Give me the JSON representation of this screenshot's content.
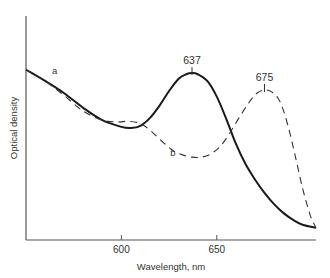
{
  "chart_data": {
    "type": "line",
    "title": "",
    "xlabel": "Wavelength, nm",
    "ylabel": "Optical density",
    "xlim": [
      550,
      702
    ],
    "ylim": [
      0,
      1
    ],
    "grid": false,
    "legend": "none (inline labels)",
    "x_ticks": [
      {
        "value": 600,
        "label": "600"
      },
      {
        "value": 650,
        "label": "650"
      }
    ],
    "series": [
      {
        "name": "a",
        "style": "solid",
        "label_at": {
          "x": 565,
          "y": 0.74
        },
        "points": [
          [
            550,
            0.76
          ],
          [
            560,
            0.71
          ],
          [
            570,
            0.655
          ],
          [
            580,
            0.59
          ],
          [
            590,
            0.535
          ],
          [
            600,
            0.505
          ],
          [
            605,
            0.5
          ],
          [
            610,
            0.51
          ],
          [
            615,
            0.545
          ],
          [
            620,
            0.6
          ],
          [
            625,
            0.665
          ],
          [
            630,
            0.72
          ],
          [
            634,
            0.74
          ],
          [
            637,
            0.745
          ],
          [
            640,
            0.74
          ],
          [
            645,
            0.71
          ],
          [
            650,
            0.64
          ],
          [
            655,
            0.54
          ],
          [
            660,
            0.43
          ],
          [
            665,
            0.34
          ],
          [
            670,
            0.27
          ],
          [
            675,
            0.21
          ],
          [
            680,
            0.16
          ],
          [
            685,
            0.12
          ],
          [
            690,
            0.09
          ],
          [
            695,
            0.068
          ],
          [
            702,
            0.054
          ]
        ]
      },
      {
        "name": "b",
        "style": "dashed",
        "label_at": {
          "x": 627,
          "y": 0.375
        },
        "points": [
          [
            550,
            0.76
          ],
          [
            560,
            0.71
          ],
          [
            570,
            0.645
          ],
          [
            580,
            0.575
          ],
          [
            590,
            0.535
          ],
          [
            598,
            0.527
          ],
          [
            603,
            0.53
          ],
          [
            608,
            0.525
          ],
          [
            612,
            0.51
          ],
          [
            617,
            0.475
          ],
          [
            622,
            0.435
          ],
          [
            627,
            0.4
          ],
          [
            632,
            0.38
          ],
          [
            637,
            0.37
          ],
          [
            642,
            0.37
          ],
          [
            647,
            0.385
          ],
          [
            652,
            0.42
          ],
          [
            657,
            0.48
          ],
          [
            662,
            0.55
          ],
          [
            667,
            0.615
          ],
          [
            671,
            0.655
          ],
          [
            675,
            0.67
          ],
          [
            679,
            0.66
          ],
          [
            683,
            0.62
          ],
          [
            687,
            0.52
          ],
          [
            691,
            0.38
          ],
          [
            695,
            0.23
          ],
          [
            699,
            0.11
          ],
          [
            702,
            0.054
          ]
        ]
      }
    ],
    "annotations": [
      {
        "text": "637",
        "x": 637,
        "y": 0.745,
        "series": "a"
      },
      {
        "text": "675",
        "x": 675,
        "y": 0.67,
        "series": "b"
      }
    ]
  }
}
